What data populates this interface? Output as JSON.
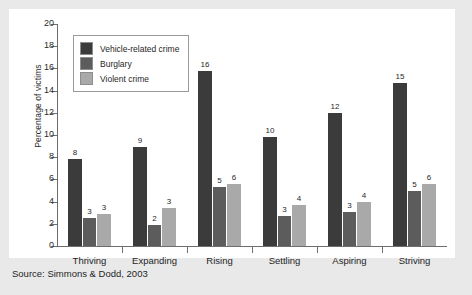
{
  "source_note": "Source: Simmons & Dodd, 2003",
  "legend": {
    "position": "inside-top-left",
    "items": [
      {
        "label": "Vehicle-related crime",
        "color": "#3b3b3b"
      },
      {
        "label": "Burglary",
        "color": "#5c5c5c"
      },
      {
        "label": "Violent crime",
        "color": "#a9a9a9"
      }
    ]
  },
  "chart_data": {
    "type": "bar",
    "title": "",
    "subtitle": "",
    "xlabel": "",
    "ylabel": "Percentage of victims",
    "categories": [
      "Thriving",
      "Expanding",
      "Rising",
      "Settling",
      "Aspiring",
      "Striving"
    ],
    "series": [
      {
        "name": "Vehicle-related crime",
        "color": "#3b3b3b",
        "values": [
          8,
          9,
          16,
          10,
          12,
          15
        ],
        "plotted": [
          7.8,
          8.9,
          15.8,
          9.8,
          12.0,
          14.7
        ]
      },
      {
        "name": "Burglary",
        "color": "#5c5c5c",
        "values": [
          3,
          2,
          5,
          3,
          3,
          5
        ],
        "plotted": [
          2.5,
          1.9,
          5.3,
          2.7,
          3.1,
          5.0
        ]
      },
      {
        "name": "Violent crime",
        "color": "#a9a9a9",
        "values": [
          3,
          3,
          6,
          4,
          4,
          6
        ],
        "plotted": [
          2.9,
          3.4,
          5.6,
          3.7,
          4.0,
          5.6
        ]
      }
    ],
    "ylim": [
      0,
      20
    ],
    "yticks": [
      0,
      2,
      4,
      6,
      8,
      10,
      12,
      14,
      16,
      18,
      20
    ],
    "ytick_labels": [
      "0",
      "2",
      "4",
      "6",
      "8",
      "10",
      "12",
      "14",
      "16",
      "18",
      "20"
    ],
    "grid": false,
    "legend_position": "upper left",
    "value_labels": true
  },
  "colors": {
    "page_background": "#e9e9ea",
    "panel_background": "#ffffff",
    "axis": "#6e6e6e",
    "text": "#1f1f1f"
  }
}
